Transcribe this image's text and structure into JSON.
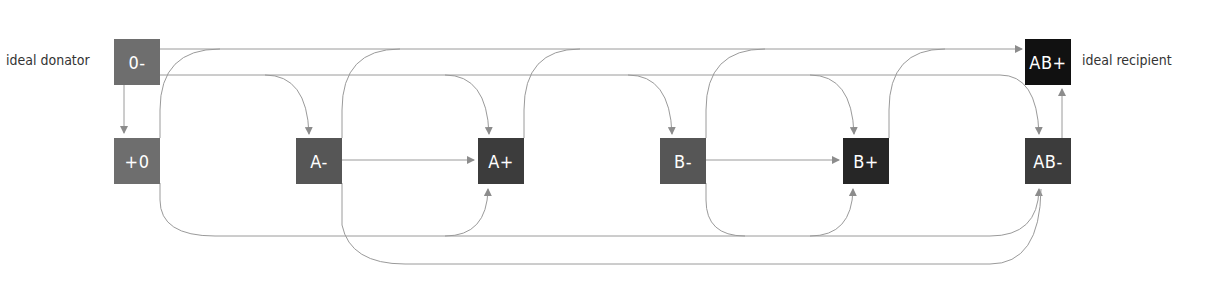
{
  "labels": {
    "donor": "ideal donator",
    "recipient": "ideal recipient"
  },
  "nodes": [
    {
      "id": "o-neg",
      "text": "0-",
      "color": "#6e6e6e"
    },
    {
      "id": "o-pos",
      "text": "+0",
      "color": "#6e6e6e"
    },
    {
      "id": "a-neg",
      "text": "A-",
      "color": "#565656"
    },
    {
      "id": "a-pos",
      "text": "A+",
      "color": "#3c3c3c"
    },
    {
      "id": "b-neg",
      "text": "B-",
      "color": "#565656"
    },
    {
      "id": "b-pos",
      "text": "B+",
      "color": "#262626"
    },
    {
      "id": "ab-neg",
      "text": "AB-",
      "color": "#3c3c3c"
    },
    {
      "id": "ab-pos",
      "text": "AB+",
      "color": "#111111"
    }
  ],
  "edges": [
    [
      "0-",
      "+0"
    ],
    [
      "0-",
      "A-"
    ],
    [
      "0-",
      "A+"
    ],
    [
      "0-",
      "B-"
    ],
    [
      "0-",
      "B+"
    ],
    [
      "0-",
      "AB-"
    ],
    [
      "0-",
      "AB+"
    ],
    [
      "+0",
      "A+"
    ],
    [
      "+0",
      "B+"
    ],
    [
      "+0",
      "AB+"
    ],
    [
      "A-",
      "A+"
    ],
    [
      "A-",
      "AB-"
    ],
    [
      "A-",
      "AB+"
    ],
    [
      "A+",
      "AB+"
    ],
    [
      "B-",
      "B+"
    ],
    [
      "B-",
      "AB-"
    ],
    [
      "B-",
      "AB+"
    ],
    [
      "B+",
      "AB+"
    ],
    [
      "AB-",
      "AB+"
    ]
  ],
  "colors": {
    "line": "#8c8c8c",
    "text_on_node": "#ffffff"
  }
}
